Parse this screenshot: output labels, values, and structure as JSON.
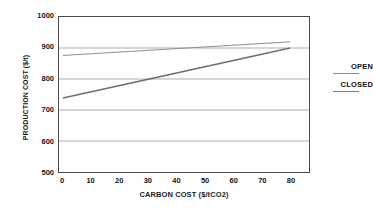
{
  "chart_data": {
    "type": "line",
    "title": "",
    "xlabel": "CARBON COST ($/tCO2)",
    "ylabel": "PRODUCTION COST ($/t)",
    "xlim": [
      0,
      80
    ],
    "ylim": [
      500,
      1000
    ],
    "xticks": [
      0,
      10,
      20,
      30,
      40,
      50,
      60,
      70,
      80
    ],
    "yticks": [
      500,
      600,
      700,
      800,
      900,
      1000
    ],
    "xtick_labels": [
      "0",
      "10",
      "20",
      "30",
      "40",
      "50",
      "60",
      "70",
      "80"
    ],
    "ytick_labels": [
      "500",
      "600",
      "700",
      "800",
      "900",
      "1000"
    ],
    "grid": "horizontal",
    "legend_position": "right",
    "series": [
      {
        "name": "OPEN",
        "color": "#8d8d8d",
        "width": 1,
        "x": [
          0,
          80
        ],
        "values": [
          876,
          920
        ]
      },
      {
        "name": "CLOSED",
        "color": "#6e6e6e",
        "width": 1.6,
        "x": [
          0,
          80
        ],
        "values": [
          739,
          900
        ]
      }
    ]
  },
  "axes": {
    "y_title": "PRODUCTION COST ($/t)",
    "x_title": "CARBON COST ($/tCO2)"
  },
  "legend": {
    "entries": [
      {
        "label": "OPEN"
      },
      {
        "label": "CLOSED"
      }
    ]
  },
  "colors": {
    "frame": "#4a4a4a",
    "grid": "#9a9a9a",
    "open_line": "#8d8d8d",
    "closed_line": "#6e6e6e",
    "text": "#141414",
    "background": "#ffffff"
  }
}
